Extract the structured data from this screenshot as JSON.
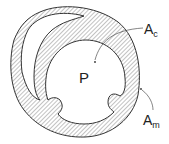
{
  "diagram": {
    "labels": {
      "center": "P",
      "ac_main": "A",
      "ac_sub": "c",
      "am_main": "A",
      "am_sub": "m"
    },
    "colors": {
      "stroke": "#333333",
      "hatch": "#555555",
      "background": "#ffffff"
    }
  }
}
